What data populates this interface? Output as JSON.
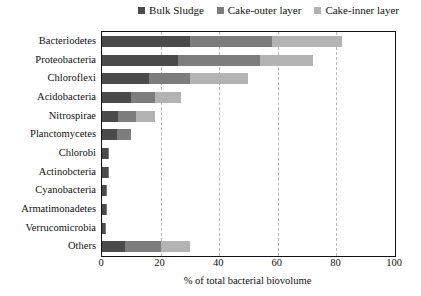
{
  "chart_data": {
    "type": "bar",
    "orientation": "horizontal",
    "stacked": true,
    "title": "",
    "xlabel": "% of total bacterial biovolume",
    "ylabel": "",
    "xlim": [
      0,
      100
    ],
    "xticks": [
      0,
      20,
      40,
      60,
      80,
      100
    ],
    "grid": "vertical-dashed",
    "legend_position": "top-right",
    "categories": [
      "Bacteriodetes",
      "Proteobacteria",
      "Chloroflexi",
      "Acidobacteria",
      "Nitrospirae",
      "Planctomycetes",
      "Chlorobi",
      "Actinobcteria",
      "Cyanobacteria",
      "Armatimonadetes",
      "Verrucomicrobia",
      "Others"
    ],
    "series": [
      {
        "name": "Bulk Sludge",
        "color": "#4b4b4b",
        "values": [
          30,
          26,
          16,
          10,
          5.5,
          5,
          2,
          2,
          1.5,
          1.2,
          1,
          8
        ]
      },
      {
        "name": "Cake-outer layer",
        "color": "#7d7d7d",
        "values": [
          28,
          28,
          14,
          8,
          6,
          5,
          0.5,
          0.5,
          0.3,
          0.3,
          0.2,
          12
        ]
      },
      {
        "name": "Cake-inner layer",
        "color": "#b3b3b3",
        "values": [
          24,
          18,
          20,
          9,
          6.5,
          0,
          0,
          0,
          0,
          0,
          0,
          10
        ]
      }
    ],
    "totals": [
      82,
      72,
      50,
      27,
      18,
      10,
      2.5,
      2.5,
      1.8,
      1.5,
      1.2,
      30
    ]
  },
  "legend": {
    "items": [
      {
        "label": "Bulk Sludge",
        "color": "#4b4b4b"
      },
      {
        "label": "Cake-outer layer",
        "color": "#7d7d7d"
      },
      {
        "label": "Cake-inner layer",
        "color": "#b3b3b3"
      }
    ]
  },
  "axis": {
    "x_title": "% of total bacterial biovolume",
    "x_tick_labels": [
      "0",
      "20",
      "40",
      "60",
      "80",
      "100"
    ]
  }
}
